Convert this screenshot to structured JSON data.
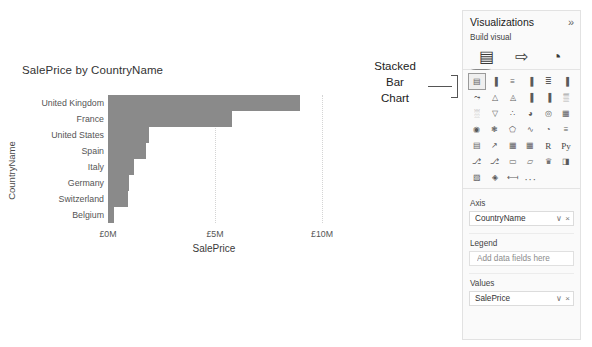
{
  "chart_data": {
    "type": "bar",
    "orientation": "horizontal",
    "title": "SalePrice by CountryName",
    "xlabel": "SalePrice",
    "ylabel": "CountryName",
    "categories": [
      "United Kingdom",
      "France",
      "United States",
      "Spain",
      "Italy",
      "Germany",
      "Switzerland",
      "Belgium"
    ],
    "values": [
      8.97,
      5.8,
      1.92,
      1.78,
      1.21,
      0.98,
      0.93,
      0.28
    ],
    "value_unit": "millions GBP",
    "xlim": [
      0,
      10
    ],
    "xticks": [
      0,
      5,
      10
    ],
    "xtick_labels": [
      "£0M",
      "£5M",
      "£10M"
    ],
    "grid": "vertical-dotted",
    "bar_color": "#8a8a8a",
    "legend": null
  },
  "callout": {
    "lines": [
      "Stacked",
      "Bar",
      "Chart"
    ]
  },
  "viz_pane": {
    "title": "Visualizations",
    "expand_icon": "»",
    "build_visual_label": "Build visual",
    "tabs": [
      {
        "name": "build-visual-tab",
        "icon": "fields-table-icon",
        "glyph": "▤",
        "active": true
      },
      {
        "name": "format-visual-tab",
        "icon": "paint-roller-icon",
        "glyph": "⇨",
        "active": false
      },
      {
        "name": "analytics-tab",
        "icon": "magnifier-icon",
        "glyph": "◔",
        "active": false
      }
    ],
    "icons": [
      {
        "name": "stacked-bar-chart-icon",
        "label": "Stacked bar chart",
        "glyph": "▤",
        "selected": true
      },
      {
        "name": "stacked-column-chart-icon",
        "label": "Stacked column chart",
        "glyph": "▐",
        "selected": false
      },
      {
        "name": "clustered-bar-chart-icon",
        "label": "Clustered bar chart",
        "glyph": "≡",
        "selected": false
      },
      {
        "name": "clustered-column-chart-icon",
        "label": "Clustered column chart",
        "glyph": "▐",
        "selected": false
      },
      {
        "name": "hundred-percent-stacked-bar-chart-icon",
        "label": "100% stacked bar chart",
        "glyph": "≣",
        "selected": false
      },
      {
        "name": "hundred-percent-stacked-column-chart-icon",
        "label": "100% stacked column chart",
        "glyph": "▐",
        "selected": false
      },
      {
        "name": "line-chart-icon",
        "label": "Line chart",
        "glyph": "⤳",
        "selected": false
      },
      {
        "name": "area-chart-icon",
        "label": "Area chart",
        "glyph": "△",
        "selected": false
      },
      {
        "name": "stacked-area-chart-icon",
        "label": "Stacked area chart",
        "glyph": "◬",
        "selected": false
      },
      {
        "name": "line-and-stacked-column-chart-icon",
        "label": "Line and stacked column chart",
        "glyph": "▐",
        "selected": false
      },
      {
        "name": "line-and-clustered-column-chart-icon",
        "label": "Line and clustered column chart",
        "glyph": "▐",
        "selected": false
      },
      {
        "name": "ribbon-chart-icon",
        "label": "Ribbon chart",
        "glyph": "▒",
        "selected": false
      },
      {
        "name": "waterfall-chart-icon",
        "label": "Waterfall chart",
        "glyph": "░",
        "selected": false
      },
      {
        "name": "funnel-chart-icon",
        "label": "Funnel chart",
        "glyph": "▽",
        "selected": false
      },
      {
        "name": "scatter-chart-icon",
        "label": "Scatter chart",
        "glyph": "∴",
        "selected": false
      },
      {
        "name": "pie-chart-icon",
        "label": "Pie chart",
        "glyph": "◕",
        "selected": false
      },
      {
        "name": "donut-chart-icon",
        "label": "Donut chart",
        "glyph": "◎",
        "selected": false
      },
      {
        "name": "treemap-icon",
        "label": "Treemap",
        "glyph": "▦",
        "selected": false
      },
      {
        "name": "map-icon",
        "label": "Map",
        "glyph": "◉",
        "selected": false
      },
      {
        "name": "filled-map-icon",
        "label": "Filled map",
        "glyph": "❃",
        "selected": false
      },
      {
        "name": "shape-map-icon",
        "label": "Shape map",
        "glyph": "⬠",
        "selected": false
      },
      {
        "name": "azure-map-icon",
        "label": "Azure map",
        "glyph": "∿",
        "selected": false
      },
      {
        "name": "gauge-icon",
        "label": "Gauge",
        "glyph": "◔",
        "selected": false
      },
      {
        "name": "card-icon",
        "label": "Card",
        "glyph": "≡",
        "selected": false
      },
      {
        "name": "multi-row-card-icon",
        "label": "Multi-row card",
        "glyph": "▤",
        "selected": false
      },
      {
        "name": "kpi-icon",
        "label": "KPI",
        "glyph": "↗",
        "selected": false
      },
      {
        "name": "slicer-icon",
        "label": "Slicer",
        "glyph": "▦",
        "selected": false
      },
      {
        "name": "table-icon",
        "label": "Table",
        "glyph": "▦",
        "selected": false
      },
      {
        "name": "r-script-visual-icon",
        "label": "R script visual",
        "glyph": "R",
        "selected": false,
        "text": true
      },
      {
        "name": "python-visual-icon",
        "label": "Python visual",
        "glyph": "Py",
        "selected": false,
        "text": true
      },
      {
        "name": "decomposition-tree-icon",
        "label": "Decomposition tree",
        "glyph": "⎇",
        "selected": false
      },
      {
        "name": "key-influencers-icon",
        "label": "Key influencers",
        "glyph": "⎇",
        "selected": false
      },
      {
        "name": "smart-narrative-icon",
        "label": "Smart narrative",
        "glyph": "▭",
        "selected": false
      },
      {
        "name": "paginated-report-icon",
        "label": "Paginated report",
        "glyph": "▱",
        "selected": false
      },
      {
        "name": "scorecard-icon",
        "label": "Metrics scorecard",
        "glyph": "♛",
        "selected": false
      },
      {
        "name": "power-apps-icon",
        "label": "Power Apps for Power BI",
        "glyph": "◨",
        "selected": false
      },
      {
        "name": "power-automate-icon",
        "label": "Power Automate",
        "glyph": "▨",
        "selected": false
      },
      {
        "name": "arcgis-maps-icon",
        "label": "ArcGIS Maps",
        "glyph": "◈",
        "selected": false
      },
      {
        "name": "visio-visual-icon",
        "label": "Visio visual",
        "glyph": "⟻",
        "selected": false
      },
      {
        "name": "more-visuals-icon",
        "label": "More visuals",
        "glyph": "···",
        "selected": false
      }
    ],
    "wells": [
      {
        "name": "axis",
        "label": "Axis",
        "value": "CountryName",
        "empty": false,
        "chevron": "∨",
        "remove": "×"
      },
      {
        "name": "legend",
        "label": "Legend",
        "value": "Add data fields here",
        "empty": true,
        "chevron": "",
        "remove": ""
      },
      {
        "name": "values",
        "label": "Values",
        "value": "SalePrice",
        "empty": false,
        "chevron": "∨",
        "remove": "×"
      }
    ]
  }
}
